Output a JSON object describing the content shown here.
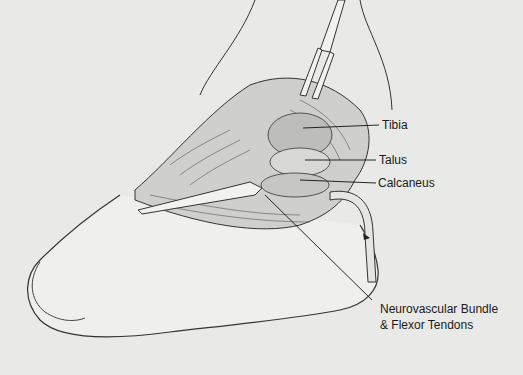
{
  "illustration": {
    "subject": "Foot surgical approach illustration",
    "labels": {
      "tibia": "Tibia",
      "talus": "Talus",
      "calcaneus": "Calcaneus",
      "neurovascular_line1": "Neurovascular Bundle",
      "neurovascular_line2": "& Flexor Tendons"
    }
  }
}
